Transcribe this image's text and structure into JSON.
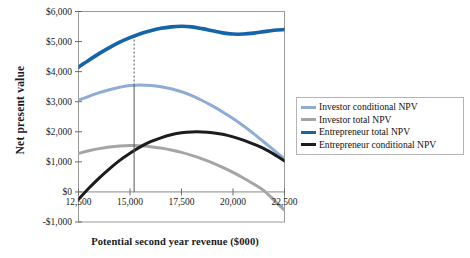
{
  "chart_data": {
    "type": "line",
    "title": "",
    "xlabel": "Potential second year revenue ($000)",
    "ylabel": "Net present value",
    "xlim": [
      12500,
      22500
    ],
    "ylim": [
      -1000,
      6000
    ],
    "xticks": [
      "12,500",
      "15,000",
      "17,500",
      "20,000",
      "22,500"
    ],
    "xtick_values": [
      12500,
      15000,
      17500,
      20000,
      22500
    ],
    "yticks": [
      "-$1,000",
      "$0",
      "$1,000",
      "$2,000",
      "$3,000",
      "$4,000",
      "$5,000",
      "$6,000"
    ],
    "ytick_values": [
      -1000,
      0,
      1000,
      2000,
      3000,
      4000,
      5000,
      6000
    ],
    "grid": false,
    "legend_position": "right",
    "x": [
      12500,
      13000,
      13500,
      14000,
      14500,
      15000,
      15500,
      16000,
      16500,
      17000,
      17500,
      18000,
      18500,
      19000,
      19500,
      20000,
      20500,
      21000,
      21500,
      22000,
      22500
    ],
    "series": [
      {
        "name": "Investor conditional NPV",
        "color": "#8fadd4",
        "width": 3.0,
        "values": [
          3050,
          3180,
          3300,
          3400,
          3480,
          3540,
          3555,
          3540,
          3500,
          3430,
          3330,
          3200,
          3040,
          2860,
          2660,
          2440,
          2200,
          1940,
          1660,
          1380,
          1100
        ]
      },
      {
        "name": "Investor total NPV",
        "color": "#a5a5a5",
        "width": 3.0,
        "values": [
          1280,
          1370,
          1440,
          1495,
          1530,
          1545,
          1535,
          1505,
          1460,
          1395,
          1315,
          1215,
          1100,
          965,
          815,
          650,
          465,
          265,
          45,
          -280,
          -610
        ]
      },
      {
        "name": "Entrepreneur total NPV",
        "color": "#1464aa",
        "width": 3.6,
        "values": [
          4150,
          4380,
          4600,
          4800,
          4980,
          5130,
          5260,
          5360,
          5440,
          5490,
          5510,
          5490,
          5430,
          5360,
          5290,
          5250,
          5250,
          5280,
          5330,
          5375,
          5400
        ]
      },
      {
        "name": "Entrepreneur conditional NPV",
        "color": "#1c1c1c",
        "width": 3.0,
        "values": [
          -250,
          120,
          460,
          770,
          1050,
          1290,
          1500,
          1670,
          1800,
          1900,
          1965,
          1995,
          1995,
          1970,
          1915,
          1830,
          1720,
          1590,
          1440,
          1250,
          1030
        ]
      }
    ],
    "annotations": [
      {
        "name": "optimum-reference-line",
        "x": 15200,
        "style_upper": "dashed",
        "style_lower": "solid",
        "y_top": 5200,
        "y_mid": 3550,
        "y_bottom": 0
      }
    ]
  },
  "legend": {
    "items": [
      {
        "label": "Investor conditional NPV",
        "color": "#8fadd4",
        "thickness": "3px"
      },
      {
        "label": "Investor total NPV",
        "color": "#a5a5a5",
        "thickness": "3px"
      },
      {
        "label": "Entrepreneur total NPV",
        "color": "#1464aa",
        "thickness": "3.5px"
      },
      {
        "label": "Entrepreneur conditional NPV",
        "color": "#1c1c1c",
        "thickness": "3px"
      }
    ]
  },
  "axes": {
    "y_title": "Net present value",
    "x_title": "Potential second year revenue ($000)",
    "frame_color": "#9a9a9a"
  }
}
